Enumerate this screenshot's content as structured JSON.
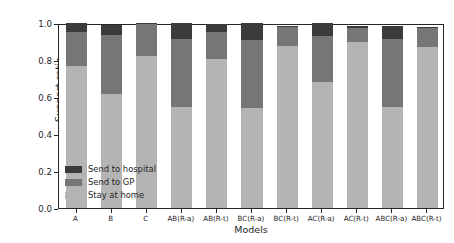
{
  "chart_data": {
    "type": "bar",
    "stacked": true,
    "title": "",
    "xlabel": "Models",
    "ylabel": "Support ratio",
    "ylim": [
      0.0,
      1.0
    ],
    "yticks": [
      "0.0",
      "0.2",
      "0.4",
      "0.6",
      "0.8",
      "1.0"
    ],
    "ytick_values": [
      0.0,
      0.2,
      0.4,
      0.6,
      0.8,
      1.0
    ],
    "grid": false,
    "legend_position": "lower left inside axes",
    "categories": [
      "A",
      "B",
      "C",
      "AB(R-a)",
      "AB(R-t)",
      "BC(R-a)",
      "BC(R-t)",
      "AC(R-a)",
      "AC(R-t)",
      "ABC(R-a)",
      "ABC(R-t)"
    ],
    "series": [
      {
        "name": "Stay at home",
        "color": "#b4b4b4",
        "values": [
          0.77,
          0.615,
          0.82,
          0.545,
          0.805,
          0.54,
          0.875,
          0.68,
          0.9,
          0.545,
          0.87
        ]
      },
      {
        "name": "Send to GP",
        "color": "#767676",
        "values": [
          0.18,
          0.32,
          0.175,
          0.37,
          0.145,
          0.37,
          0.105,
          0.25,
          0.075,
          0.37,
          0.105
        ]
      },
      {
        "name": "Send to hospital",
        "color": "#3b3b3b",
        "values": [
          0.05,
          0.055,
          0.005,
          0.085,
          0.045,
          0.09,
          0.005,
          0.07,
          0.01,
          0.07,
          0.005
        ]
      }
    ],
    "totals": [
      1.0,
      0.99,
      1.0,
      1.0,
      0.995,
      1.0,
      0.985,
      1.0,
      0.985,
      0.985,
      0.98
    ]
  },
  "legend": {
    "items": [
      {
        "label": "Send to hospital",
        "color": "#3b3b3b"
      },
      {
        "label": "Send to GP",
        "color": "#767676"
      },
      {
        "label": "Stay at home",
        "color": "#b4b4b4"
      }
    ]
  },
  "axes": {
    "ylabel": "Support ratio",
    "xlabel": "Models"
  }
}
